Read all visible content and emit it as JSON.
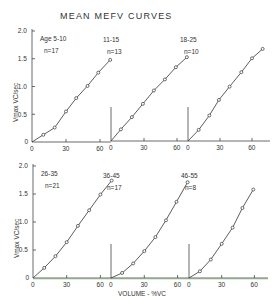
{
  "title": "MEAN MEFV CURVES",
  "y_axis_label": "Vmax VC/sec",
  "x_axis_label": "VOLUME - %VC",
  "y_ticks": [
    "0",
    "0.5",
    "1.0",
    "1.5",
    "2.0"
  ],
  "x_ticks": [
    "0",
    "30",
    "60"
  ],
  "colors": {
    "ink": "#333333",
    "axis_tint_bottom": "#b8e0b8"
  },
  "chart_data": [
    {
      "type": "line",
      "panel": "top-left",
      "label": "Age 5-10",
      "n_label": "n=17",
      "xlabel": "",
      "ylabel": "Vmax VC/sec",
      "xlim": [
        0,
        70
      ],
      "ylim": [
        0,
        2.0
      ],
      "x": [
        0,
        10,
        20,
        30,
        39,
        49,
        58.5,
        69
      ],
      "y": [
        0,
        0.13,
        0.26,
        0.55,
        0.79,
        1.01,
        1.25,
        1.48
      ]
    },
    {
      "type": "line",
      "panel": "top-middle",
      "label": "11-15",
      "n_label": "n=13",
      "xlim": [
        0,
        70
      ],
      "ylim": [
        0,
        2.0
      ],
      "x": [
        0,
        9,
        19,
        29,
        39,
        49,
        59,
        69
      ],
      "y": [
        0,
        0.21,
        0.43,
        0.67,
        0.91,
        1.11,
        1.33,
        1.51
      ]
    },
    {
      "type": "line",
      "panel": "top-right",
      "label": "18-25",
      "n_label": "n=10",
      "xlim": [
        0,
        70
      ],
      "ylim": [
        0,
        2.0
      ],
      "x": [
        0,
        10,
        20,
        29,
        39,
        50,
        60,
        70
      ],
      "y": [
        0,
        0.2,
        0.46,
        0.74,
        0.98,
        1.24,
        1.49,
        1.66
      ]
    },
    {
      "type": "line",
      "panel": "bottom-left",
      "label": "26-35",
      "n_label": "n=21",
      "xlabel": "",
      "ylabel": "Vmax VC/sec",
      "xlim": [
        0,
        70
      ],
      "ylim": [
        0,
        2.0
      ],
      "x": [
        0,
        10,
        20,
        30,
        40,
        50,
        60,
        70
      ],
      "y": [
        0,
        0.18,
        0.39,
        0.64,
        0.93,
        1.21,
        1.49,
        1.74
      ]
    },
    {
      "type": "line",
      "panel": "bottom-middle",
      "label": "36-45",
      "n_label": "n=17",
      "xlabel": "VOLUME - %VC",
      "xlim": [
        0,
        70
      ],
      "ylim": [
        0,
        2.0
      ],
      "x": [
        0,
        10,
        20,
        30,
        40,
        49.5,
        59,
        69
      ],
      "y": [
        0,
        0.09,
        0.26,
        0.48,
        0.73,
        1.03,
        1.36,
        1.71
      ]
    },
    {
      "type": "line",
      "panel": "bottom-right",
      "label": "46-55",
      "n_label": "n=8",
      "xlim": [
        0,
        70
      ],
      "ylim": [
        0,
        2.0
      ],
      "x": [
        0,
        10,
        20,
        30,
        40,
        49,
        59
      ],
      "y": [
        0,
        0.12,
        0.33,
        0.61,
        0.9,
        1.25,
        1.58
      ]
    }
  ]
}
